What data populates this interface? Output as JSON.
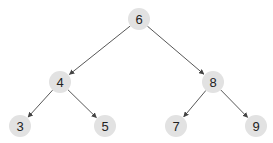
{
  "diagram": {
    "type": "binary-tree",
    "colors": {
      "node_fill": "#e2e2e2",
      "edge": "#444444",
      "text": "#222222"
    },
    "nodes": [
      {
        "id": "n6",
        "label": "6",
        "x": 139,
        "y": 19
      },
      {
        "id": "n4",
        "label": "4",
        "x": 60,
        "y": 82
      },
      {
        "id": "n8",
        "label": "8",
        "x": 213,
        "y": 82
      },
      {
        "id": "n3",
        "label": "3",
        "x": 20,
        "y": 126
      },
      {
        "id": "n5",
        "label": "5",
        "x": 105,
        "y": 126
      },
      {
        "id": "n7",
        "label": "7",
        "x": 176,
        "y": 126
      },
      {
        "id": "n9",
        "label": "9",
        "x": 256,
        "y": 126
      }
    ],
    "edges": [
      {
        "from": "n6",
        "to": "n4"
      },
      {
        "from": "n6",
        "to": "n8"
      },
      {
        "from": "n4",
        "to": "n3"
      },
      {
        "from": "n4",
        "to": "n5"
      },
      {
        "from": "n8",
        "to": "n7"
      },
      {
        "from": "n8",
        "to": "n9"
      }
    ]
  }
}
